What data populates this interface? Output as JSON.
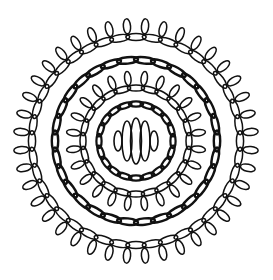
{
  "artwork": {
    "subject": "mandala line-art",
    "colors": {
      "background": "#ffffff",
      "ink": "#111111"
    },
    "rings": [
      {
        "name": "outer-ring",
        "chain_links": 40,
        "petals": 40,
        "petals_outward": true,
        "bold": false
      },
      {
        "name": "second-ring",
        "chain_links": 30,
        "petals": 0,
        "petals_outward": false,
        "bold": true
      },
      {
        "name": "third-ring",
        "chain_links": 24,
        "petals": 24,
        "petals_outward": true,
        "bold": false
      },
      {
        "name": "inner-ring",
        "chain_links": 20,
        "petals": 0,
        "petals_outward": false,
        "bold": true
      }
    ],
    "center_ovals": 5
  }
}
